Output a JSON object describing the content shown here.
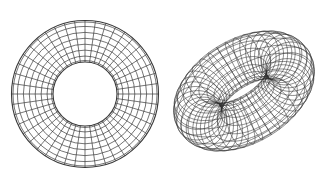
{
  "canvas": {
    "width": 322,
    "height": 180,
    "background": "#ffffff"
  },
  "figures": [
    {
      "name": "annulus-mesh",
      "type": "polar-grid-annulus",
      "center": [
        85,
        94
      ],
      "outer_radius": 73.5,
      "inner_radius": 32,
      "rings": 8,
      "radial_lines": 44,
      "stroke": "#3a3a3a",
      "stroke_width": 0.7
    },
    {
      "name": "torus-wireframe",
      "type": "torus-3d-wireframe",
      "center": [
        244,
        91
      ],
      "major_radius": 52,
      "minor_radius": 24,
      "u_segments": 40,
      "v_segments": 18,
      "rotation_x_deg": 58,
      "rotation_z_deg": -32,
      "scale_y": 1.0,
      "stroke": "#2e2e2e",
      "stroke_width": 0.55
    }
  ]
}
